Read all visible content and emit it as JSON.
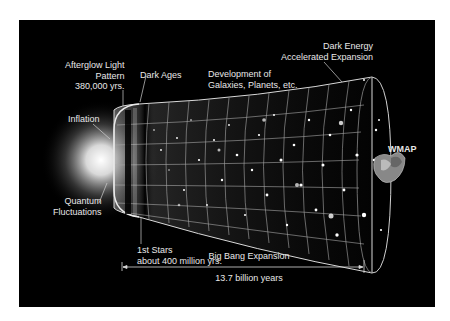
{
  "diagram": {
    "colors": {
      "background": "#000000",
      "page": "#ffffff",
      "text": "#e8e8e8",
      "grid": "#bfbfbf",
      "glow": "#ffffff"
    },
    "labels": {
      "afterglow": {
        "line1": "Afterglow Light",
        "line2": "Pattern",
        "line3": "380,000 yrs."
      },
      "dark_ages": "Dark Ages",
      "development": {
        "line1": "Development of",
        "line2": "Galaxies, Planets, etc."
      },
      "dark_energy": {
        "line1": "Dark Energy",
        "line2": "Accelerated Expansion"
      },
      "inflation": "Inflation",
      "wmap": "WMAP",
      "quantum": {
        "line1": "Quantum",
        "line2": "Fluctuations"
      },
      "first_stars": {
        "line1": "1st Stars",
        "line2": "about 400 million yrs."
      },
      "timeline": {
        "title": "Big Bang Expansion",
        "duration": "13.7 billion years"
      }
    }
  }
}
